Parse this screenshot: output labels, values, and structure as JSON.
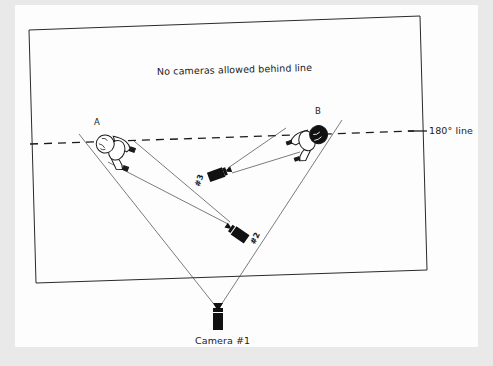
{
  "diagram": {
    "type": "camera-placement-180-degree-rule",
    "region_note": "No cameras allowed behind line",
    "axis_line_label": "180° line",
    "subjects": [
      {
        "id": "A",
        "label": "A"
      },
      {
        "id": "B",
        "label": "B"
      }
    ],
    "cameras": [
      {
        "id": "1",
        "label": "Camera #1"
      },
      {
        "id": "2",
        "label": "#2"
      },
      {
        "id": "3",
        "label": "#3"
      }
    ],
    "colors": {
      "background": "#e9e9e9",
      "page": "#fdfdfd",
      "ink": "#1a1a1a"
    }
  }
}
